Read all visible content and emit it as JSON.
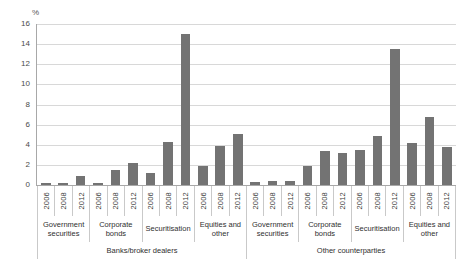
{
  "chart_data": {
    "type": "bar",
    "title": "",
    "subtitle": "",
    "xlabel": "",
    "ylabel": "%",
    "ylim": [
      0,
      16
    ],
    "yticks": [
      0,
      2,
      4,
      6,
      8,
      10,
      12,
      14,
      16
    ],
    "grid": true,
    "legend": "none",
    "bar_color": "#737373",
    "grid_color": "#d8d8d8",
    "axis_color": "#a8a8a8",
    "categories": [
      "2006",
      "2008",
      "2012",
      "2006",
      "2008",
      "2012",
      "2006",
      "2008",
      "2012",
      "2006",
      "2008",
      "2012",
      "2006",
      "2008",
      "2012",
      "2006",
      "2008",
      "2012",
      "2006",
      "2008",
      "2012",
      "2006",
      "2008",
      "2012"
    ],
    "values": [
      0.2,
      0.2,
      0.9,
      0.2,
      1.5,
      2.2,
      1.2,
      4.3,
      15.0,
      1.9,
      3.9,
      5.1,
      0.3,
      0.4,
      0.4,
      1.9,
      3.4,
      3.2,
      3.5,
      4.9,
      13.5,
      4.2,
      6.8,
      3.8
    ],
    "groups": [
      {
        "label": "Government securities",
        "span": 3
      },
      {
        "label": "Corporate bonds",
        "span": 3
      },
      {
        "label": "Securitisation",
        "span": 3
      },
      {
        "label": "Equities and other",
        "span": 3
      },
      {
        "label": "Government securities",
        "span": 3
      },
      {
        "label": "Corporate bonds",
        "span": 3
      },
      {
        "label": "Securitisation",
        "span": 3
      },
      {
        "label": "Equities and other",
        "span": 3
      }
    ],
    "supergroups": [
      {
        "label": "Banks/broker dealers",
        "span": 12
      },
      {
        "label": "Other counterparties",
        "span": 12
      }
    ]
  }
}
